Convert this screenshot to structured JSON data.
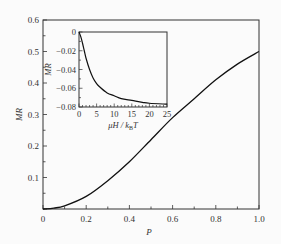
{
  "chart_data": [
    {
      "type": "line",
      "role": "main",
      "title": "",
      "xlabel": "P",
      "ylabel": "MR",
      "xlim": [
        0,
        1.0
      ],
      "ylim": [
        0,
        0.6
      ],
      "xticks": [
        "0",
        "0.2",
        "0.4",
        "0.6",
        "0.8",
        "1.0"
      ],
      "yticks": [
        "0.1",
        "0.2",
        "0.3",
        "0.4",
        "0.5",
        "0.6"
      ],
      "grid": false,
      "series": [
        {
          "name": "MR vs P",
          "x": [
            0,
            0.05,
            0.1,
            0.2,
            0.3,
            0.4,
            0.5,
            0.6,
            0.7,
            0.8,
            0.9,
            1.0
          ],
          "y": [
            0,
            0.003,
            0.01,
            0.04,
            0.09,
            0.15,
            0.22,
            0.29,
            0.35,
            0.41,
            0.46,
            0.5
          ]
        }
      ]
    },
    {
      "type": "line",
      "role": "inset",
      "title": "",
      "xlabel": "μH / k_B T",
      "ylabel": "MR",
      "xlim": [
        0,
        25
      ],
      "ylim": [
        -0.08,
        0
      ],
      "xticks": [
        "0",
        "5",
        "10",
        "15",
        "20",
        "25"
      ],
      "yticks": [
        "0",
        "-0.02",
        "-0.04",
        "-0.06",
        "-0.08"
      ],
      "grid": false,
      "series": [
        {
          "name": "MR vs μH/kBT",
          "x": [
            0,
            0.5,
            1,
            1.5,
            2,
            3,
            4,
            5,
            6,
            8,
            10,
            12,
            15,
            18,
            20,
            25
          ],
          "y": [
            0,
            -0.005,
            -0.012,
            -0.02,
            -0.028,
            -0.04,
            -0.049,
            -0.055,
            -0.059,
            -0.065,
            -0.068,
            -0.071,
            -0.073,
            -0.075,
            -0.076,
            -0.077
          ]
        }
      ]
    }
  ],
  "labels": {
    "main_xlabel": "P",
    "main_ylabel": "MR",
    "inset_ylabel": "MR",
    "inset_xlabel_mu": "μH / k",
    "inset_xlabel_sub": "B",
    "inset_xlabel_T": "T"
  }
}
